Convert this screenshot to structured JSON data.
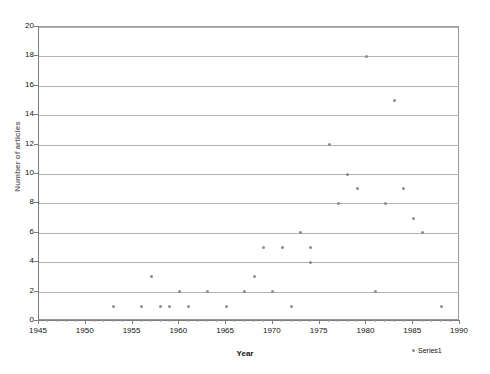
{
  "chart_data": {
    "type": "scatter",
    "title": "",
    "xlabel": "Year",
    "ylabel": "Number of articles",
    "xlim": [
      1945,
      1990
    ],
    "ylim": [
      0,
      20
    ],
    "xticks": [
      1945,
      1950,
      1955,
      1960,
      1965,
      1970,
      1975,
      1980,
      1985,
      1990
    ],
    "yticks": [
      0,
      2,
      4,
      6,
      8,
      10,
      12,
      14,
      16,
      18,
      20
    ],
    "xtick_step": 5,
    "ytick_step": 2,
    "grid": "horizontal",
    "legend_position": "bottom-right",
    "series": [
      {
        "name": "Series1",
        "marker": "diamond",
        "color": "#8a8a99",
        "points": [
          {
            "x": 1953,
            "y": 1
          },
          {
            "x": 1956,
            "y": 1
          },
          {
            "x": 1957,
            "y": 3
          },
          {
            "x": 1958,
            "y": 1
          },
          {
            "x": 1959,
            "y": 1
          },
          {
            "x": 1960,
            "y": 2
          },
          {
            "x": 1961,
            "y": 1
          },
          {
            "x": 1963,
            "y": 2
          },
          {
            "x": 1965,
            "y": 1
          },
          {
            "x": 1967,
            "y": 2
          },
          {
            "x": 1968,
            "y": 3
          },
          {
            "x": 1969,
            "y": 5
          },
          {
            "x": 1970,
            "y": 2
          },
          {
            "x": 1971,
            "y": 5
          },
          {
            "x": 1972,
            "y": 1
          },
          {
            "x": 1973,
            "y": 6
          },
          {
            "x": 1974,
            "y": 4
          },
          {
            "x": 1974,
            "y": 5
          },
          {
            "x": 1976,
            "y": 12
          },
          {
            "x": 1977,
            "y": 8
          },
          {
            "x": 1978,
            "y": 10
          },
          {
            "x": 1979,
            "y": 9
          },
          {
            "x": 1980,
            "y": 18
          },
          {
            "x": 1981,
            "y": 2
          },
          {
            "x": 1982,
            "y": 8
          },
          {
            "x": 1983,
            "y": 15
          },
          {
            "x": 1984,
            "y": 9
          },
          {
            "x": 1985,
            "y": 7
          },
          {
            "x": 1986,
            "y": 6
          },
          {
            "x": 1988,
            "y": 1
          }
        ]
      }
    ]
  },
  "legend": {
    "entries": [
      "Series1"
    ]
  }
}
